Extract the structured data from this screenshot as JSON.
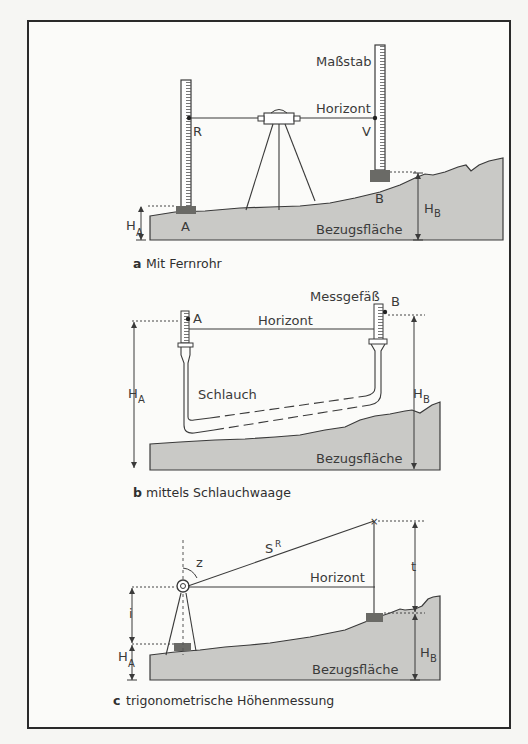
{
  "figure": {
    "panel_a": {
      "caption_letter": "a",
      "caption": "Mit Fernrohr",
      "labels": {
        "staff": "Maßstab",
        "horizon": "Horizont",
        "back_reading": "R",
        "fore_reading": "V",
        "point_a": "A",
        "point_b": "B",
        "height_a": "H",
        "height_a_sub": "A",
        "height_b": "H",
        "height_b_sub": "B",
        "datum": "Bezugsfläche"
      }
    },
    "panel_b": {
      "caption_letter": "b",
      "caption": "mittels Schlauchwaage",
      "labels": {
        "vessel": "Messgefäß",
        "point_a": "A",
        "point_b": "B",
        "horizon": "Horizont",
        "hose": "Schlauch",
        "height_a": "H",
        "height_a_sub": "A",
        "height_b": "H",
        "height_b_sub": "B",
        "datum": "Bezugsfläche"
      }
    },
    "panel_c": {
      "caption_letter": "c",
      "caption": "trigonometrische Höhenmessung",
      "labels": {
        "slope_distance": "S",
        "slope_distance_sup": "R",
        "zenith_angle": "z",
        "horizon": "Horizont",
        "target_height": "t",
        "instrument_height": "i",
        "height_a": "H",
        "height_a_sub": "A",
        "height_b": "H",
        "height_b_sub": "B",
        "datum": "Bezugsfläche"
      }
    }
  },
  "colors": {
    "ground_fill": "#c9c9c6",
    "line": "#3a3a3a",
    "footplate": "#6a6a66",
    "frame": "#2a2a2a"
  }
}
